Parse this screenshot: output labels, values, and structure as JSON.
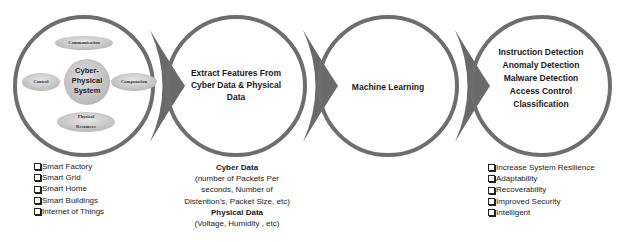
{
  "colors": {
    "ring": "#6e6e6e",
    "arrow": "#6a6a6a",
    "ellipse_fill": "#cfcfcf",
    "center_fill": "#c9c9c9",
    "text": "#1a1a1a"
  },
  "stages": [
    {
      "id": "cps",
      "center_title": [
        "Cyber-",
        "Physical",
        "System"
      ],
      "satellites": {
        "top": "Communication",
        "left": "Control",
        "right": "Computation",
        "bottom": [
          "Physical",
          "Resources"
        ]
      }
    },
    {
      "id": "extract",
      "lines": [
        "Extract Features From",
        "Cyber Data & Physical",
        "Data"
      ]
    },
    {
      "id": "ml",
      "lines": [
        "Machine Learning"
      ]
    },
    {
      "id": "apps",
      "lines": [
        "Instruction Detection",
        "Anomaly Detection",
        "Malware Detection",
        "Access Control",
        "Classification"
      ]
    }
  ],
  "below": {
    "domains": [
      "Smart Factory",
      "Smart Grid",
      "Smart Home",
      "Smart Buildings",
      "Internet of Things"
    ],
    "data": {
      "cyber_title": "Cyber Data",
      "cyber_lines": [
        "(number of Packets Per",
        "seconds, Number of",
        "Distention’s, Packet Size, etc)"
      ],
      "physical_title": "Physical Data",
      "physical_lines": [
        "(Voltage, Humidity , etc)"
      ]
    },
    "benefits": [
      "Increase System Resilience",
      "Adaptability",
      "Recoverability",
      "Improved Security",
      "Intelligent"
    ]
  }
}
